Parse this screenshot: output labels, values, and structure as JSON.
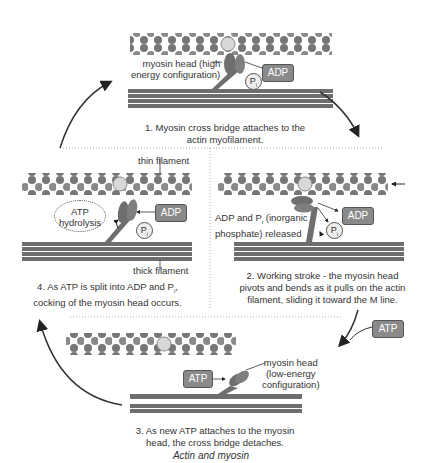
{
  "diagram": {
    "title": "Actin and myosin",
    "steps": [
      {
        "caption_line1": "1. Myosin cross bridge attaches to the",
        "caption_line2": "actin myofilament.",
        "head_label_line1": "myosin head (high",
        "head_label_line2": "energy configuration)",
        "adp": "ADP",
        "pi": "P"
      },
      {
        "caption_line1": "2. Working stroke - the myosin head",
        "caption_line2": "pivots and bends as it pulls on the actin",
        "caption_line3": "filament, sliding it toward the M line.",
        "release_line1": "ADP and P",
        "release_line1b": " (inorganic",
        "release_line2": "phosphate) released",
        "adp": "ADP",
        "pi": "P"
      },
      {
        "caption_line1": "3. As new ATP attaches to the myosin",
        "caption_line2": "head, the cross bridge detaches.",
        "head_label_line1": "myosin head",
        "head_label_line2": "(low-energy",
        "head_label_line3": "configuration)",
        "atp": "ATP",
        "atp_in": "ATP"
      },
      {
        "caption_line1": "4. As ATP is split into ADP and P",
        "caption_line1b": ",",
        "caption_line2": "cocking of the myosin head occurs.",
        "thin_label": "thin filament",
        "thick_label": "thick filament",
        "hydro_line1": "ATP",
        "hydro_line2": "hydrolysis",
        "adp": "ADP",
        "pi": "P"
      }
    ],
    "pi_sub": "i",
    "colors": {
      "actin": "#7a7a7a",
      "actin_highlight": "#d8d8d8",
      "myosin": "#6e6e6e",
      "box": "#8a8a8a",
      "arrow": "#333333"
    }
  }
}
